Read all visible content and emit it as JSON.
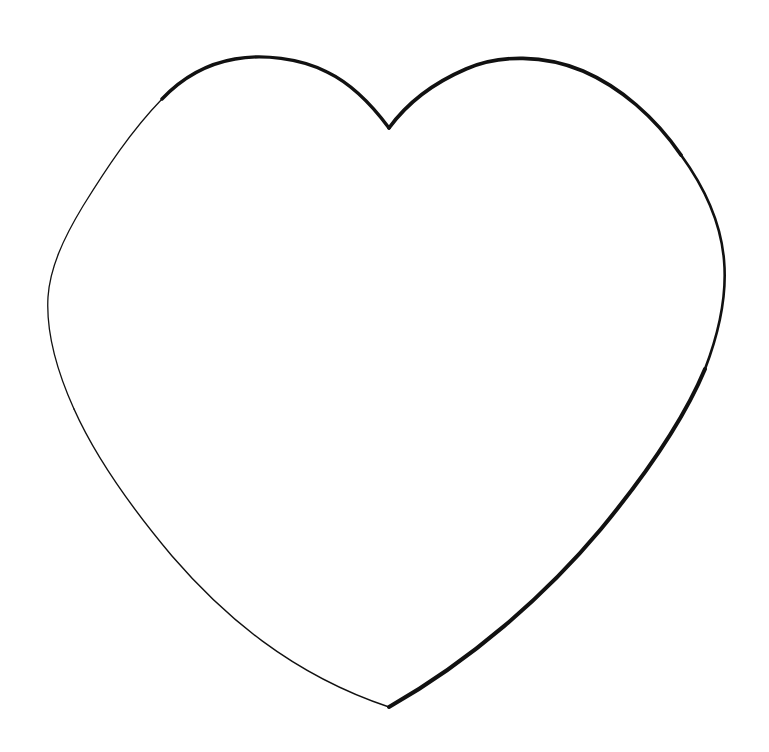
{
  "page": {
    "width": 769,
    "height": 752,
    "background_color": "#ffffff",
    "alt_text": "Black outline drawing of a heart shape on a plain white background"
  },
  "artwork": {
    "name": "heart-outline",
    "type": "line-drawing",
    "subject": "heart",
    "fill_color": "#ffffff",
    "stroke_color": "#111111",
    "stroke_style": "variable-width hand-drawn outline",
    "bounding_box": {
      "x": 47,
      "y": 57,
      "width": 678,
      "height": 650
    },
    "key_points": {
      "top_cleft": {
        "x": 389,
        "y": 128
      },
      "bottom_tip": {
        "x": 389,
        "y": 707
      },
      "left_extreme": {
        "x": 47,
        "y": 265
      },
      "right_extreme": {
        "x": 725,
        "y": 260
      },
      "left_lobe_top": {
        "x": 238,
        "y": 58
      },
      "right_lobe_top": {
        "x": 543,
        "y": 59
      }
    },
    "strokes": [
      {
        "id": "left-lobe-upper",
        "label": "Left lobe upper arc",
        "weight": 3.4,
        "path": "M 389 128 C 372 105 352 84 327 72 C 300 58 262 54 235 59 C 206 64 181 79 162 99"
      },
      {
        "id": "left-side",
        "label": "Left outer side",
        "weight": 1.3,
        "path": "M 162 99 C 131 131 106 169 83 206 C 63 239 50 268 48 297 C 46 331 56 369 74 409"
      },
      {
        "id": "left-lower",
        "label": "Left lower descending edge",
        "weight": 1.4,
        "path": "M 74 409 C 95 456 130 506 172 556 C 222 614 290 674 389 707"
      },
      {
        "id": "right-lower",
        "label": "Right lower descending edge",
        "weight": 4.0,
        "path": "M 389 707 C 470 661 545 596 601 529 C 648 472 685 417 705 369"
      },
      {
        "id": "right-side",
        "label": "Right outer side",
        "weight": 2.6,
        "path": "M 705 369 C 720 330 727 293 724 260 C 721 224 705 188 681 155"
      },
      {
        "id": "right-lobe-upper",
        "label": "Right lobe upper arc",
        "weight": 3.6,
        "path": "M 681 155 C 655 117 620 87 583 71 C 545 55 500 54 466 69 C 431 84 405 106 389 128"
      }
    ]
  }
}
